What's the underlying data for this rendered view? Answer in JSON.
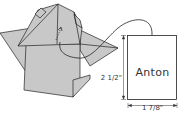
{
  "diagram": {
    "tag": {
      "name_text": "Anton",
      "height_label": "2 1/2\"",
      "width_label": "1 7/8\""
    },
    "colors": {
      "paper_fill": "#c8c8c8",
      "line": "#222222",
      "background": "#ffffff"
    }
  }
}
